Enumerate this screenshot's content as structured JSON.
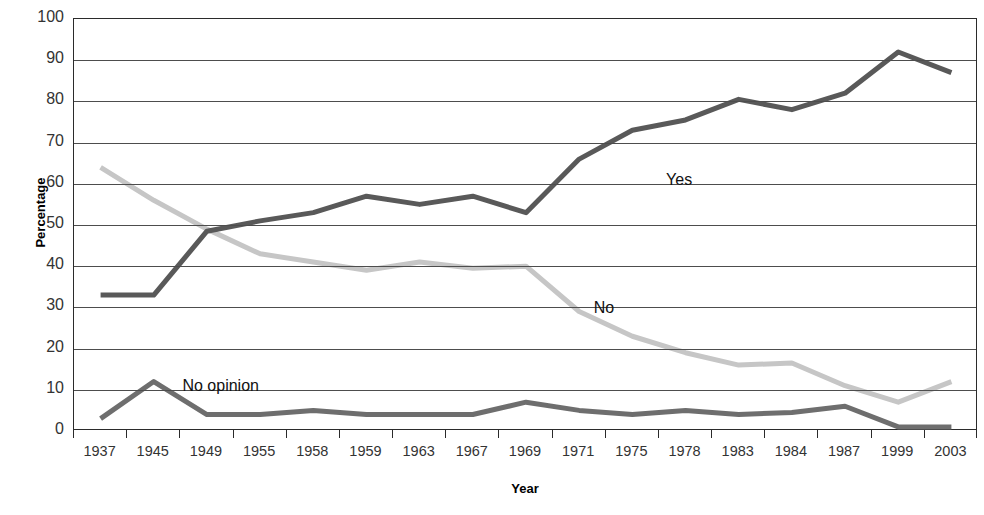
{
  "chart_data": {
    "type": "line",
    "title": "",
    "xlabel": "Year",
    "ylabel": "Percentage",
    "ylim": [
      0,
      100
    ],
    "ytick_step": 10,
    "yticks": [
      "100",
      "90",
      "80",
      "70",
      "60",
      "50",
      "40",
      "30",
      "20",
      "10",
      "0"
    ],
    "grid": true,
    "legend_position": "inline-annotations",
    "categories": [
      "1937",
      "1945",
      "1949",
      "1955",
      "1958",
      "1959",
      "1963",
      "1967",
      "1969",
      "1971",
      "1975",
      "1978",
      "1983",
      "1984",
      "1987",
      "1999",
      "2003"
    ],
    "series": [
      {
        "name": "Yes",
        "color": "#595959",
        "values": [
          33,
          33,
          48.5,
          51,
          53,
          57,
          55,
          57,
          53,
          66,
          73,
          75.5,
          80.5,
          78,
          82,
          92,
          87
        ]
      },
      {
        "name": "No",
        "color": "#c6c6c6",
        "values": [
          64,
          56,
          49,
          43,
          41,
          39,
          41,
          39.5,
          40,
          29,
          23,
          19,
          16,
          16.5,
          11,
          7,
          12
        ]
      },
      {
        "name": "No opinion",
        "color": "#6e6e6e",
        "values": [
          3,
          12,
          4,
          4,
          5,
          4,
          4,
          4,
          7,
          5,
          4,
          5,
          4,
          4.5,
          6,
          1,
          1
        ]
      }
    ],
    "annotations": [
      {
        "text": "Yes",
        "x_pct": 65.5,
        "y_pct": 37.0
      },
      {
        "text": "No",
        "x_pct": 57.5,
        "y_pct": 68.0
      },
      {
        "text": "No opinion",
        "x_pct": 12.0,
        "y_pct": 87.0
      }
    ]
  }
}
